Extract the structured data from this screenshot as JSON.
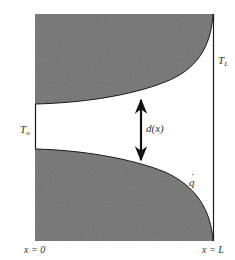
{
  "diagram": {
    "colors": {
      "shading": "#6f6f6f",
      "lines": "#1a1a1a",
      "background": "#ffffff",
      "text": "#333333"
    },
    "labels": {
      "inlet_temperature": "T",
      "inlet_temperature_sub": "o",
      "outlet_temperature": "T",
      "outlet_temperature_sub": "L",
      "gap_width": "d(x)",
      "heat_flux": "q",
      "heat_flux_dot": "·",
      "x_start": "x = 0",
      "x_end": "x = L"
    },
    "elements": {
      "upper_wall": "shaded region, profile curves from left (gap edge) up to top-right corner",
      "lower_wall": "shaded region, profile curves from left (gap edge) down to bottom-right corner",
      "arrow": "double-headed vertical arrow spanning d(x)",
      "inlet_line": "vertical line at x = 0 across gap",
      "outlet_line": "vertical line at x = L"
    }
  }
}
